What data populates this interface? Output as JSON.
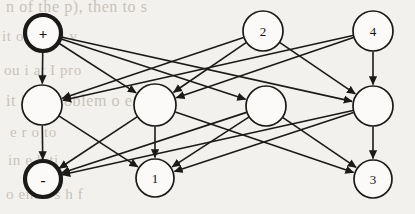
{
  "figure": {
    "background_color": "#f3f1ed",
    "ink_color": "#1c1a18",
    "node_fill": "#fbfaf8"
  },
  "background_text": [
    "n of the p), then to s",
    "it o      a   1 to    v",
    "ou i         at        I pro",
    "it is a   problem   o   e",
    "e  r       o          to",
    "in        e    h  ti",
    "o  ent  a  s       h  f"
  ],
  "graph": {
    "type": "layered-directed-graph",
    "layers": [
      {
        "name": "input",
        "y": 33
      },
      {
        "name": "hidden",
        "y": 105
      },
      {
        "name": "output",
        "y": 179
      }
    ],
    "nodes": [
      {
        "id": "in_plus",
        "label": "+",
        "x": 43,
        "y": 33,
        "r": 18,
        "bold": true,
        "layer": "input",
        "symbol": true
      },
      {
        "id": "in_a",
        "label": "",
        "x": 155,
        "y": 33,
        "r": 0,
        "bold": false,
        "layer": "input",
        "hidden": true
      },
      {
        "id": "in_2",
        "label": "2",
        "x": 263,
        "y": 31,
        "r": 20,
        "bold": false,
        "layer": "input",
        "symbol": false
      },
      {
        "id": "in_4",
        "label": "4",
        "x": 373,
        "y": 31,
        "r": 20,
        "bold": false,
        "layer": "input",
        "symbol": false
      },
      {
        "id": "h_1",
        "label": "",
        "x": 42,
        "y": 105,
        "r": 20,
        "bold": false,
        "layer": "hidden",
        "symbol": false
      },
      {
        "id": "h_2",
        "label": "",
        "x": 155,
        "y": 105,
        "r": 21,
        "bold": false,
        "layer": "hidden",
        "symbol": false
      },
      {
        "id": "h_3",
        "label": "",
        "x": 266,
        "y": 106,
        "r": 20,
        "bold": false,
        "layer": "hidden",
        "symbol": false
      },
      {
        "id": "h_4",
        "label": "",
        "x": 373,
        "y": 106,
        "r": 20,
        "bold": false,
        "layer": "hidden",
        "symbol": false
      },
      {
        "id": "out_minus",
        "label": "-",
        "x": 43,
        "y": 179,
        "r": 18,
        "bold": true,
        "layer": "output",
        "symbol": true
      },
      {
        "id": "out_1",
        "label": "1",
        "x": 155,
        "y": 178,
        "r": 19,
        "bold": false,
        "layer": "output",
        "symbol": false
      },
      {
        "id": "out_3",
        "label": "3",
        "x": 373,
        "y": 179,
        "r": 19,
        "bold": false,
        "layer": "output",
        "symbol": false
      }
    ],
    "edges": [
      {
        "from": "in_plus",
        "to": "h_1",
        "directed": true
      },
      {
        "from": "in_plus",
        "to": "h_2",
        "directed": true
      },
      {
        "from": "in_plus",
        "to": "h_3",
        "directed": true
      },
      {
        "from": "in_plus",
        "to": "h_4",
        "directed": true
      },
      {
        "from": "in_2",
        "to": "h_1",
        "directed": true
      },
      {
        "from": "in_2",
        "to": "h_2",
        "directed": true
      },
      {
        "from": "in_2",
        "to": "h_4",
        "directed": true
      },
      {
        "from": "in_4",
        "to": "h_1",
        "directed": true
      },
      {
        "from": "in_4",
        "to": "h_2",
        "directed": true
      },
      {
        "from": "in_4",
        "to": "h_4",
        "directed": true
      },
      {
        "from": "h_1",
        "to": "out_minus",
        "directed": true
      },
      {
        "from": "h_1",
        "to": "out_1",
        "directed": true
      },
      {
        "from": "h_2",
        "to": "out_minus",
        "directed": true
      },
      {
        "from": "h_2",
        "to": "out_1",
        "directed": true
      },
      {
        "from": "h_2",
        "to": "out_3",
        "directed": true
      },
      {
        "from": "h_3",
        "to": "out_minus",
        "directed": true
      },
      {
        "from": "h_3",
        "to": "out_1",
        "directed": true
      },
      {
        "from": "h_3",
        "to": "out_3",
        "directed": true
      },
      {
        "from": "h_4",
        "to": "out_minus",
        "directed": true
      },
      {
        "from": "h_4",
        "to": "out_1",
        "directed": true
      },
      {
        "from": "h_4",
        "to": "out_3",
        "directed": true
      }
    ]
  }
}
